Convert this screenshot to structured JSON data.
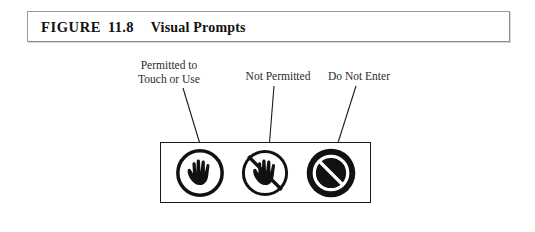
{
  "figure": {
    "caption": {
      "figure_word": "FIGURE",
      "number": "11.8",
      "title": "Visual Prompts"
    },
    "labels": [
      {
        "id": "permitted",
        "line1": "Permitted to",
        "line2": "Touch or Use"
      },
      {
        "id": "not-permitted",
        "line1": "Not Permitted",
        "line2": ""
      },
      {
        "id": "do-not-enter",
        "line1": "Do Not Enter",
        "line2": ""
      }
    ],
    "icons": [
      {
        "id": "open-hand-circle",
        "name": "open-hand-in-circle-icon",
        "meaning": "Permitted to Touch or Use"
      },
      {
        "id": "hand-slashed-circle",
        "name": "hand-with-slash-icon",
        "meaning": "Not Permitted"
      },
      {
        "id": "prohibition-filled",
        "name": "no-entry-filled-icon",
        "meaning": "Do Not Enter"
      }
    ],
    "colors": {
      "ink": "#1a1a1a",
      "caption_border": "#8c8c8c",
      "label_text": "#2b2b2b",
      "background": "#ffffff"
    }
  }
}
